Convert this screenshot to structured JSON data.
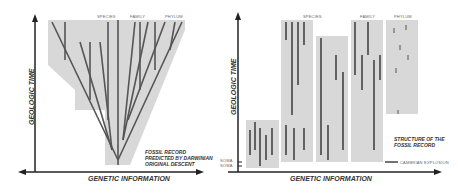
{
  "left": {
    "y_axis_label": "GEOLOGIC TIME",
    "x_axis_label": "GENETIC INFORMATION",
    "column_labels": [
      "SPECIES",
      "FAMILY",
      "PHYLUM"
    ],
    "caption": [
      "FOSSIL RECORD",
      "PREDICTED BY DARWINIAN",
      "ORIGINAL DESCENT"
    ]
  },
  "right": {
    "y_axis_label": "GEOLOGIC TIME",
    "x_axis_label": "GENETIC INFORMATION",
    "column_labels": [
      "SPECIES",
      "FAMILY",
      "PHYLUM"
    ],
    "caption": [
      "STRUCTURE OF THE",
      "FOSSIL RECORD"
    ],
    "legend": "CAMBRIAN EXPLOSION",
    "tick_labels": [
      "SOMA",
      "SOMA"
    ]
  },
  "colors": {
    "bar": "#555555",
    "block": "#d8d8d8",
    "axis": "#222222"
  }
}
